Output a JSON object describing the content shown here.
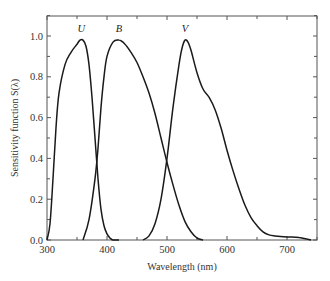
{
  "chart_data": {
    "type": "line",
    "title": "",
    "xlabel": "Wavelength (nm)",
    "ylabel": "Sensitivity function S(λ)",
    "xlim": [
      300,
      750
    ],
    "ylim": [
      0.0,
      1.1
    ],
    "xticks": [
      300,
      400,
      500,
      600,
      700
    ],
    "xtick_labels": [
      "300",
      "400",
      "500",
      "600",
      "700"
    ],
    "yticks": [
      0.0,
      0.2,
      0.4,
      0.6,
      0.8,
      1.0
    ],
    "ytick_labels": [
      "0.0",
      "0.2",
      "0.4",
      "0.6",
      "0.8",
      "1.0"
    ],
    "grid": false,
    "legend": "none (curves labeled directly above peaks)",
    "series": [
      {
        "name": "U",
        "x": [
          300,
          305,
          310,
          315,
          320,
          330,
          340,
          350,
          355,
          360,
          365,
          370,
          375,
          380,
          385,
          390,
          395,
          400,
          405,
          410,
          420
        ],
        "y": [
          0.0,
          0.08,
          0.3,
          0.55,
          0.72,
          0.86,
          0.92,
          0.96,
          0.98,
          0.98,
          0.95,
          0.86,
          0.7,
          0.5,
          0.3,
          0.15,
          0.07,
          0.03,
          0.01,
          0.0,
          0.0
        ]
      },
      {
        "name": "B",
        "x": [
          360,
          370,
          380,
          385,
          390,
          395,
          400,
          410,
          420,
          430,
          440,
          450,
          460,
          470,
          480,
          490,
          500,
          510,
          520,
          530,
          540,
          550,
          560
        ],
        "y": [
          0.0,
          0.1,
          0.3,
          0.45,
          0.65,
          0.8,
          0.9,
          0.97,
          0.98,
          0.96,
          0.92,
          0.87,
          0.8,
          0.72,
          0.62,
          0.5,
          0.38,
          0.27,
          0.17,
          0.09,
          0.04,
          0.01,
          0.0
        ]
      },
      {
        "name": "V",
        "x": [
          460,
          470,
          480,
          490,
          500,
          510,
          520,
          525,
          530,
          535,
          540,
          550,
          560,
          570,
          580,
          590,
          600,
          610,
          620,
          630,
          640,
          650,
          660,
          670,
          680,
          700,
          720,
          740
        ],
        "y": [
          0.0,
          0.02,
          0.08,
          0.2,
          0.4,
          0.65,
          0.86,
          0.94,
          0.98,
          0.97,
          0.93,
          0.82,
          0.74,
          0.7,
          0.64,
          0.55,
          0.44,
          0.34,
          0.25,
          0.17,
          0.11,
          0.07,
          0.04,
          0.025,
          0.02,
          0.015,
          0.012,
          0.0
        ]
      }
    ],
    "annotations": [
      {
        "text": "U",
        "x": 357,
        "y": 1.02
      },
      {
        "text": "B",
        "x": 420,
        "y": 1.02
      },
      {
        "text": "V",
        "x": 530,
        "y": 1.02
      }
    ]
  },
  "colors": {
    "curve": "#1a1a1a",
    "axis": "#555555",
    "text": "#333333",
    "background": "#ffffff"
  }
}
